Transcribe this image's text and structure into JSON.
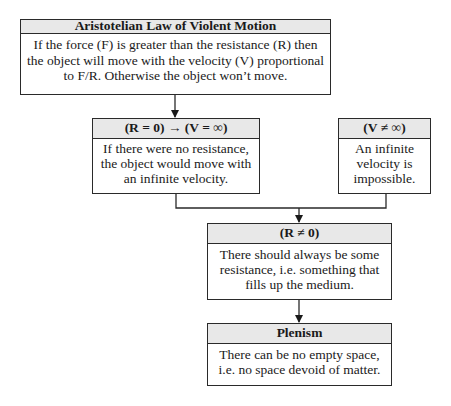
{
  "diagram": {
    "nodes": {
      "law": {
        "title": "Aristotelian Law of Violent Motion",
        "body_lines": [
          "If the force (F) is greater than the resistance (R) then",
          "the object will move with the velocity (V) proportional",
          "to F/R. Otherwise the object won’t move."
        ]
      },
      "r_zero": {
        "title": "(R = 0) → (V = ∞)",
        "body_lines": [
          "If there were no resistance,",
          "the object would move with",
          "an infinite velocity."
        ]
      },
      "v_not_inf": {
        "title": "(V ≠ ∞)",
        "body_lines": [
          "An infinite",
          "velocity is",
          "impossible."
        ]
      },
      "r_not_zero": {
        "title": "(R ≠ 0)",
        "body_lines": [
          "There should always be some",
          "resistance, i.e. something that",
          "fills up the medium."
        ]
      },
      "plenism": {
        "title": "Plenism",
        "body_lines": [
          "There can be no empty space,",
          "i.e. no space devoid of matter."
        ]
      }
    },
    "edges": [
      {
        "from": "law",
        "to": "r_zero"
      },
      {
        "from": "r_zero",
        "to": "r_not_zero"
      },
      {
        "from": "v_not_inf",
        "to": "r_not_zero"
      },
      {
        "from": "r_not_zero",
        "to": "plenism"
      }
    ],
    "colors": {
      "header_fill": "#e8e8e8",
      "stroke": "#2a2a2a",
      "background": "#ffffff"
    }
  }
}
